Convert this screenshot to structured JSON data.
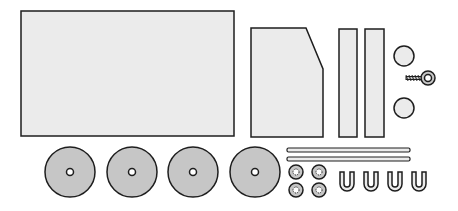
{
  "colors": {
    "panel_fill": "#ebebeb",
    "wheel_fill": "#c6c6c6",
    "outline": "#1e1e1e",
    "background": "#ffffff"
  },
  "parts": {
    "body_panel": {
      "x": 21,
      "y": 11,
      "w": 213,
      "h": 125
    },
    "cab_panel": {
      "points": "251,28 306,28 323,69 323,137 251,137"
    },
    "side_strips": [
      {
        "x": 339,
        "y": 29,
        "w": 18,
        "h": 108
      },
      {
        "x": 365,
        "y": 29,
        "w": 19,
        "h": 108
      }
    ],
    "lights": [
      {
        "cx": 404,
        "cy": 56,
        "r": 10
      },
      {
        "cx": 404,
        "cy": 108,
        "r": 10
      }
    ],
    "eye_screw": {
      "cx": 428,
      "cy": 78
    },
    "wheels": [
      {
        "cx": 70,
        "cy": 172,
        "r": 25
      },
      {
        "cx": 132,
        "cy": 172,
        "r": 25
      },
      {
        "cx": 193,
        "cy": 172,
        "r": 25
      },
      {
        "cx": 255,
        "cy": 172,
        "r": 25
      }
    ],
    "axles": [
      {
        "x": 287,
        "y": 148,
        "w": 123,
        "h": 4
      },
      {
        "x": 287,
        "y": 157,
        "w": 123,
        "h": 4
      }
    ],
    "hubs": [
      {
        "cx": 296,
        "cy": 172
      },
      {
        "cx": 319,
        "cy": 172
      },
      {
        "cx": 296,
        "cy": 190
      },
      {
        "cx": 319,
        "cy": 190
      }
    ],
    "u_clips": [
      {
        "x": 340
      },
      {
        "x": 364
      },
      {
        "x": 388
      },
      {
        "x": 412
      }
    ]
  }
}
